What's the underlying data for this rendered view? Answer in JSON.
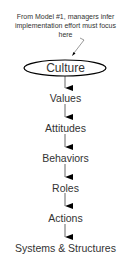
{
  "annotation": {
    "line1": "From Model #1, managers infer",
    "line2": "implementation effort must focus",
    "line3": "here"
  },
  "chain": [
    {
      "label": "Culture",
      "highlighted": true
    },
    {
      "label": "Values"
    },
    {
      "label": "Attitudes"
    },
    {
      "label": "Behaviors"
    },
    {
      "label": "Roles"
    },
    {
      "label": "Actions"
    },
    {
      "label": "Systems & Structures"
    }
  ],
  "colors": {
    "text": "#333333",
    "lines": "#000000",
    "background": "#ffffff"
  }
}
